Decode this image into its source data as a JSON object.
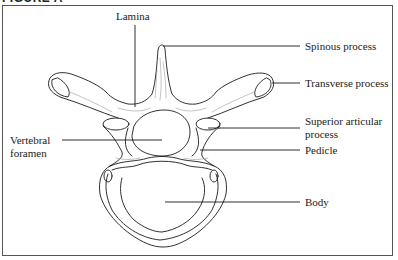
{
  "figure": {
    "title": "FIGURE A"
  },
  "labels": {
    "lamina": "Lamina",
    "spinous_process": "Spinous process",
    "transverse_process": "Transverse process",
    "superior_articular_process_line1": "Superior articular",
    "superior_articular_process_line2": "process",
    "pedicle": "Pedicle",
    "body": "Body",
    "vertebral_foramen_line1": "Vertebral",
    "vertebral_foramen_line2": "foramen"
  },
  "colors": {
    "ink": "#1a1a1a",
    "frame": "#555555",
    "shading": "#9a9a9a"
  }
}
